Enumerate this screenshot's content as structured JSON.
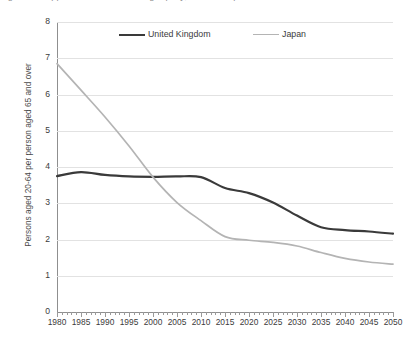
{
  "figure": {
    "title_cutoff": "Figure 1. Support ratios are declining rapidly, UK and Japan",
    "background": "#ffffff"
  },
  "legend": {
    "position": "top-center-inside",
    "entries": [
      {
        "label": "United Kingdom",
        "color": "#3a3a3a",
        "width": 2.2
      },
      {
        "label": "Japan",
        "color": "#b4b4b4",
        "width": 1.8
      }
    ]
  },
  "axes": {
    "ylabel": "Persons aged 20-64 per person aged 65 and over",
    "yticks": [
      0,
      1,
      2,
      3,
      4,
      5,
      6,
      7,
      8
    ],
    "xticks": [
      1980,
      1985,
      1990,
      1995,
      2000,
      2005,
      2010,
      2015,
      2020,
      2025,
      2030,
      2035,
      2040,
      2045,
      2050
    ],
    "grid": true,
    "gridcolor": "#e2e2e2",
    "axiscolor": "#8f8f8f"
  },
  "chart_data": {
    "type": "line",
    "title": "Figure 1. Support ratios are declining rapidly, UK and Japan",
    "xlabel": "",
    "ylabel": "Persons aged 20-64 per person aged 65 and over",
    "xlim": [
      1980,
      2050
    ],
    "ylim": [
      0,
      8
    ],
    "grid": true,
    "legend_position": "top-center",
    "x": [
      1980,
      1985,
      1990,
      1995,
      2000,
      2005,
      2010,
      2015,
      2020,
      2025,
      2030,
      2035,
      2040,
      2045,
      2050
    ],
    "series": [
      {
        "name": "United Kingdom",
        "color": "#3a3a3a",
        "values": [
          3.75,
          3.86,
          3.78,
          3.74,
          3.73,
          3.74,
          3.72,
          3.42,
          3.28,
          3.02,
          2.66,
          2.34,
          2.26,
          2.22,
          2.16
        ]
      },
      {
        "name": "Japan",
        "color": "#b4b4b4",
        "values": [
          6.85,
          6.12,
          5.38,
          4.58,
          3.72,
          3.02,
          2.52,
          2.08,
          1.98,
          1.92,
          1.82,
          1.64,
          1.48,
          1.38,
          1.32
        ]
      }
    ]
  }
}
